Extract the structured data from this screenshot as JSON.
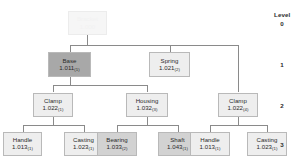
{
  "diagram": {
    "type": "bill-of-materials-tree",
    "legend": {
      "title": "Level",
      "levels": [
        "0",
        "1",
        "2",
        "3"
      ]
    },
    "nodes": [
      {
        "id": "root",
        "name": "Bracket",
        "part": "1.000",
        "qty": "",
        "level": 0,
        "shade": "root"
      },
      {
        "id": "base",
        "name": "Base",
        "part": "1.011",
        "qty": "(1)",
        "level": 1,
        "shade": "dark"
      },
      {
        "id": "spring",
        "name": "Spring",
        "part": "1.021",
        "qty": "(2)",
        "level": 1,
        "shade": "light"
      },
      {
        "id": "clamp-a",
        "name": "Clamp",
        "part": "1.022",
        "qty": "(1)",
        "level": 2,
        "shade": "light"
      },
      {
        "id": "housing",
        "name": "Housing",
        "part": "1.032",
        "qty": "(3)",
        "level": 2,
        "shade": "light"
      },
      {
        "id": "clamp-b",
        "name": "Clamp",
        "part": "1.022",
        "qty": "(4)",
        "level": 2,
        "shade": "light"
      },
      {
        "id": "handle-a",
        "name": "Handle",
        "part": "1.013",
        "qty": "(1)",
        "level": 3,
        "shade": "light"
      },
      {
        "id": "casting-a",
        "name": "Casting",
        "part": "1.023",
        "qty": "(1)",
        "level": 3,
        "shade": "light"
      },
      {
        "id": "bearing",
        "name": "Bearing",
        "part": "1.033",
        "qty": "(2)",
        "level": 3,
        "shade": "mid"
      },
      {
        "id": "shaft",
        "name": "Shaft",
        "part": "1.043",
        "qty": "(1)",
        "level": 3,
        "shade": "mid"
      },
      {
        "id": "handle-b",
        "name": "Handle",
        "part": "1.013",
        "qty": "(1)",
        "level": 3,
        "shade": "light"
      },
      {
        "id": "casting-b",
        "name": "Casting",
        "part": "1.023",
        "qty": "(1)",
        "level": 3,
        "shade": "light"
      }
    ],
    "edges": [
      {
        "from": "root",
        "to": "base"
      },
      {
        "from": "root",
        "to": "spring"
      },
      {
        "from": "root",
        "to": "clamp-b"
      },
      {
        "from": "base",
        "to": "clamp-a"
      },
      {
        "from": "base",
        "to": "housing"
      },
      {
        "from": "clamp-a",
        "to": "handle-a"
      },
      {
        "from": "clamp-a",
        "to": "casting-a"
      },
      {
        "from": "housing",
        "to": "bearing"
      },
      {
        "from": "housing",
        "to": "shaft"
      },
      {
        "from": "clamp-b",
        "to": "handle-b"
      },
      {
        "from": "clamp-b",
        "to": "casting-b"
      }
    ],
    "colors": {
      "line": "#8a8a8a",
      "fill_light": "#eeeeee",
      "fill_mid": "#d2d2d2",
      "fill_dark": "#a8a8a8",
      "fill_root": "#f6f6f6",
      "text": "#2b2b2b"
    }
  }
}
